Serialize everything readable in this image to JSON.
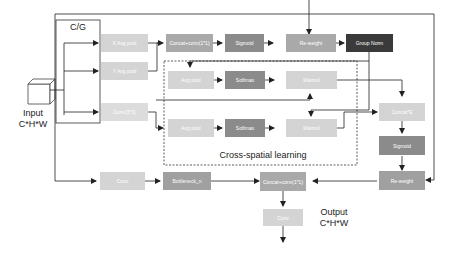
{
  "colors": {
    "light": "#d4d4d4",
    "medium": "#a9a9a9",
    "dark": "#8b8b8b",
    "darkest": "#3a3a3a",
    "line": "#222222"
  },
  "labels": {
    "group": "C/G",
    "input_line1": "Input",
    "input_line2": "C*H*W",
    "output_line1": "Output",
    "output_line2": "C*H*W",
    "cross_spatial": "Cross-spatial learning"
  },
  "boxes": {
    "x_avg_pool": "X Avg pool",
    "y_avg_pool": "Y Avg pool",
    "conv3x3_top": "Conv(3*3)",
    "concat_conv_top": "Concat+conv(1*1)",
    "sigmoid_top": "Sigmoid",
    "reweight_top": "Re-weight",
    "group_norm": "Group Norm",
    "avg_pool_1": "Avg pool",
    "softmax_1": "Softmax",
    "matmul_1": "Matmul",
    "avg_pool_2": "Avg pool",
    "softmax_2": "Softmax",
    "matmul_2": "Matmul",
    "concat_e": "Concat*E",
    "sigmoid_right": "Sigmoid",
    "reweight_right": "Re-weight",
    "conv_bottom": "Conv",
    "bottleneck": "Bottleneck_n",
    "concat_conv_bottom": "Concat+conv(1*1)",
    "conv_out": "Conv"
  }
}
